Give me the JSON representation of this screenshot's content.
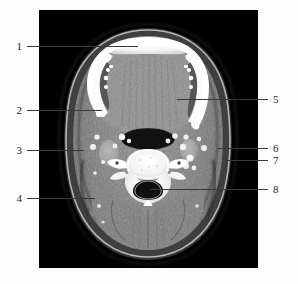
{
  "figure": {
    "kind": "labeled-medical-image",
    "modality_label": "axial-ct-neck",
    "background_color": "#fdfdfd",
    "plate_color": "#000000",
    "leader_color": "#3a3a3a",
    "numeral_color": "#1d1d1d"
  },
  "labels": [
    {
      "id": "1",
      "text": "1",
      "side": "left",
      "num_x": 17,
      "num_y": 41,
      "line_x": 27,
      "line_w": 111,
      "line_y": 46
    },
    {
      "id": "2",
      "text": "2",
      "side": "left",
      "num_x": 17,
      "num_y": 105,
      "line_x": 27,
      "line_w": 75,
      "line_y": 110
    },
    {
      "id": "3",
      "text": "3",
      "side": "left",
      "num_x": 17,
      "num_y": 145,
      "line_x": 27,
      "line_w": 57,
      "line_y": 150
    },
    {
      "id": "4",
      "text": "4",
      "side": "left",
      "num_x": 17,
      "num_y": 193,
      "line_x": 27,
      "line_w": 68,
      "line_y": 198
    },
    {
      "id": "5",
      "text": "5",
      "side": "right",
      "num_x": 273,
      "num_y": 94,
      "line_x": 177,
      "line_w": 91,
      "line_y": 99
    },
    {
      "id": "6",
      "text": "6",
      "side": "right",
      "num_x": 273,
      "num_y": 143,
      "line_x": 218,
      "line_w": 50,
      "line_y": 148
    },
    {
      "id": "7",
      "text": "7",
      "side": "right",
      "num_x": 273,
      "num_y": 155,
      "line_x": 226,
      "line_w": 42,
      "line_y": 160
    },
    {
      "id": "8",
      "text": "8",
      "side": "right",
      "num_x": 273,
      "num_y": 184,
      "line_x": 150,
      "line_w": 118,
      "line_y": 189
    }
  ],
  "ct_image": {
    "width": 219,
    "height": 258,
    "features": [
      {
        "name": "mandible-body-anterior",
        "tone": "bone-bright"
      },
      {
        "name": "mandible-ramus-left",
        "tone": "bone-bright"
      },
      {
        "name": "mandible-ramus-right",
        "tone": "bone-bright"
      },
      {
        "name": "oropharyngeal-airway",
        "tone": "air-dark"
      },
      {
        "name": "cervical-vertebral-body",
        "tone": "bone-bright"
      },
      {
        "name": "spinal-canal",
        "tone": "air-dark"
      },
      {
        "name": "transverse-process-left",
        "tone": "bone-bright"
      },
      {
        "name": "transverse-process-right",
        "tone": "bone-bright"
      },
      {
        "name": "spinous-process",
        "tone": "bone-bright"
      },
      {
        "name": "submandibular-gland-left",
        "tone": "soft-tissue"
      },
      {
        "name": "submandibular-gland-right",
        "tone": "soft-tissue"
      },
      {
        "name": "carotid-vessel-left",
        "tone": "contrast"
      },
      {
        "name": "carotid-vessel-right",
        "tone": "contrast"
      },
      {
        "name": "posterior-neck-muscles",
        "tone": "soft-tissue"
      },
      {
        "name": "skin-fat-contour",
        "tone": "fat-dark"
      }
    ]
  }
}
